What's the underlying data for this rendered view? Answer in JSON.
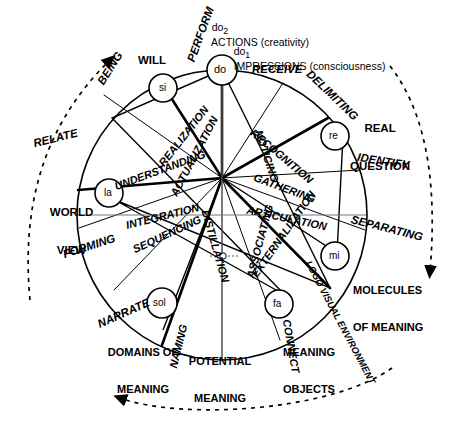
{
  "diagram": {
    "type": "radial-wheel",
    "colors": {
      "stroke": "#000000",
      "fill": "#ffffff",
      "dashed": "#1a1a1a"
    },
    "center_marker": "small-circle"
  },
  "top_notes": [
    {
      "id": "do2",
      "prefix": "do",
      "subscript": "2",
      "text": "ACTIONS (creativity)"
    },
    {
      "id": "do1",
      "prefix": "do",
      "subscript": "1",
      "text": "IMPRESSIONS (consciousness)"
    }
  ],
  "nodes": [
    {
      "id": "do",
      "label": "do",
      "angle_deg": 0
    },
    {
      "id": "re",
      "label": "re",
      "angle_deg": 51.4
    },
    {
      "id": "mi",
      "label": "mi",
      "angle_deg": 102.9
    },
    {
      "id": "fa",
      "label": "fa",
      "angle_deg": 154.3
    },
    {
      "id": "sol",
      "label": "sol",
      "angle_deg": 205.7
    },
    {
      "id": "la",
      "label": "la",
      "angle_deg": 257.1
    },
    {
      "id": "si",
      "label": "si",
      "angle_deg": 308.6
    }
  ],
  "sectors": [
    {
      "id": "actualization",
      "label": "ACTUALIZATION"
    },
    {
      "id": "noticing",
      "label": "NOTICING"
    },
    {
      "id": "recognition",
      "label": "RECOGNITION"
    },
    {
      "id": "gathering",
      "label": "GATHERING"
    },
    {
      "id": "articulation",
      "label": "ARTICULATION"
    },
    {
      "id": "externalization",
      "label": "EXTERNALIZATION"
    },
    {
      "id": "associating",
      "label": "ASSOCIATING"
    },
    {
      "id": "distillation",
      "label": "DISTILLATION"
    },
    {
      "id": "sequencing",
      "label": "SEQUENCING"
    },
    {
      "id": "integration",
      "label": "INTEGRATION"
    },
    {
      "id": "understanding",
      "label": "UNDERSTANDING"
    },
    {
      "id": "realization",
      "label": "REALIZATION"
    }
  ],
  "outer_labels": [
    {
      "id": "perform",
      "label": "PERFORM"
    },
    {
      "id": "receive",
      "label": "RECEIVE"
    },
    {
      "id": "delimiting",
      "label": "DELIMITING"
    },
    {
      "id": "identify",
      "label": "IDENTIFY"
    },
    {
      "id": "separating",
      "label": "SEPARATING"
    },
    {
      "id": "logo-visual-environment",
      "label": "LOGO VISUAL ENVIRONMENT"
    },
    {
      "id": "connect",
      "label": "CONNECT"
    },
    {
      "id": "naming",
      "label": "NAMING"
    },
    {
      "id": "narrate",
      "label": "NARRATE"
    },
    {
      "id": "forming",
      "label": "FORMING"
    },
    {
      "id": "relate",
      "label": "RELATE"
    },
    {
      "id": "being",
      "label": "BEING"
    },
    {
      "id": "will",
      "label": "WILL"
    }
  ],
  "outer_titles": [
    {
      "id": "real-question",
      "line1": "REAL",
      "line2": "QUESTION"
    },
    {
      "id": "molecules",
      "line1": "MOLECULES",
      "line2": "OF MEANING"
    },
    {
      "id": "meaning-objects",
      "line1": "MEANING",
      "line2": "OBJECTS"
    },
    {
      "id": "potential-meaning",
      "line1": "POTENTIAL",
      "line2": "MEANING"
    },
    {
      "id": "domains",
      "line1": "DOMAINS OF",
      "line2": "MEANING"
    },
    {
      "id": "world-view",
      "line1": "WORLD",
      "line2": "VIEW"
    }
  ],
  "arrows": [
    {
      "id": "arrow-upper-left",
      "direction": "counter-clockwise",
      "style": "dashed"
    },
    {
      "id": "arrow-right",
      "direction": "clockwise",
      "style": "dashed"
    },
    {
      "id": "arrow-bottom",
      "direction": "counter-clockwise",
      "style": "dashed"
    }
  ]
}
